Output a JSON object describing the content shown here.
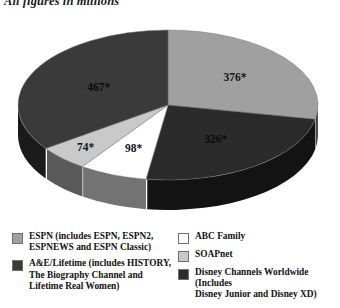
{
  "caption": "All figures in millions",
  "chart_data": {
    "type": "pie",
    "title": "All figures in millions",
    "subtitle": "",
    "xlabel": "",
    "ylabel": "",
    "units": "millions",
    "total": 1341,
    "three_d": true,
    "legend_position": "bottom",
    "grid": false,
    "categories": [
      "ESPN (includes ESPN, ESPN2, ESPNEWS and ESPN Classic)",
      "Disney Channels Worldwide (Includes Disney Junior and Disney XD)",
      "ABC Family",
      "SOAPnet",
      "A&E/Lifetime (includes HISTORY, The Biography Channel and Lifetime Real Women)"
    ],
    "values": [
      376,
      326,
      98,
      74,
      467
    ],
    "data_labels": [
      "376*",
      "326*",
      "98*",
      "74*",
      "467*"
    ],
    "colors": [
      "#a0a0a0",
      "#2b2b2b",
      "#ffffff",
      "#c9c9c9",
      "#3a3a3a"
    ],
    "slices": [
      {
        "label": "ESPN (includes ESPN, ESPN2, ESPNEWS and ESPN Classic)",
        "value": 376,
        "data_label": "376*",
        "color": "#a0a0a0",
        "percent": 28.0
      },
      {
        "label": "Disney Channels Worldwide (Includes Disney Junior and Disney XD)",
        "value": 326,
        "data_label": "326*",
        "color": "#2b2b2b",
        "percent": 24.3
      },
      {
        "label": "ABC Family",
        "value": 98,
        "data_label": "98*",
        "color": "#ffffff",
        "percent": 7.3
      },
      {
        "label": "SOAPnet",
        "value": 74,
        "data_label": "74*",
        "color": "#c9c9c9",
        "percent": 5.5
      },
      {
        "label": "A&E/Lifetime (includes HISTORY, The Biography Channel and Lifetime Real Women)",
        "value": 467,
        "data_label": "467*",
        "color": "#3a3a3a",
        "percent": 34.8
      }
    ]
  },
  "labels": {
    "espn": "376*",
    "disney": "326*",
    "abc": "98*",
    "soapnet": "74*",
    "aelifetime": "467*"
  },
  "legend": {
    "left": [
      {
        "name": "espn",
        "line1": "ESPN (includes ESPN, ESPN2,",
        "line2": "ESPNEWS and ESPN Classic)",
        "line3": "",
        "color": "#a0a0a0"
      },
      {
        "name": "ae-lifetime",
        "line1": "A&E/Lifetime (includes HISTORY,",
        "line2": "The Biography Channel and",
        "line3": "Lifetime Real Women)",
        "color": "#3a3a3a"
      }
    ],
    "right": [
      {
        "name": "abc-family",
        "line1": "ABC Family",
        "line2": "",
        "line3": "",
        "color": "#ffffff"
      },
      {
        "name": "soapnet",
        "line1": "SOAPnet",
        "line2": "",
        "line3": "",
        "color": "#c9c9c9"
      },
      {
        "name": "disney-worldwide",
        "line1": "Disney Channels Worldwide (Includes",
        "line2": "Disney Junior and Disney XD)",
        "line3": "",
        "color": "#2b2b2b"
      }
    ]
  }
}
